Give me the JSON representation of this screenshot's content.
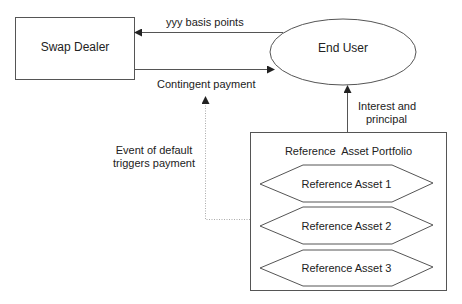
{
  "diagram": {
    "nodes": {
      "swap_dealer": {
        "label": "Swap Dealer"
      },
      "end_user": {
        "label": "End User"
      },
      "portfolio": {
        "label": "Reference  Asset Portfolio",
        "assets": [
          {
            "label": "Reference Asset 1"
          },
          {
            "label": "Reference Asset 2"
          },
          {
            "label": "Reference Asset 3"
          }
        ]
      }
    },
    "edges": {
      "premium": {
        "label": "yyy basis points",
        "from": "End User",
        "to": "Swap Dealer"
      },
      "contingent": {
        "label": "Contingent payment",
        "from": "Swap Dealer",
        "to": "End User"
      },
      "interest": {
        "label_line1": "Interest and",
        "label_line2": "principal",
        "from": "Reference  Asset Portfolio",
        "to": "End User"
      },
      "default_trigger": {
        "label_line1": "Event of default",
        "label_line2": "triggers payment",
        "from": "Reference  Asset Portfolio",
        "to": "Contingent payment",
        "style": "dotted"
      }
    },
    "colors": {
      "stroke": "#555555",
      "dotted": "#aaaaaa",
      "text": "#222222",
      "background": "#ffffff"
    }
  }
}
